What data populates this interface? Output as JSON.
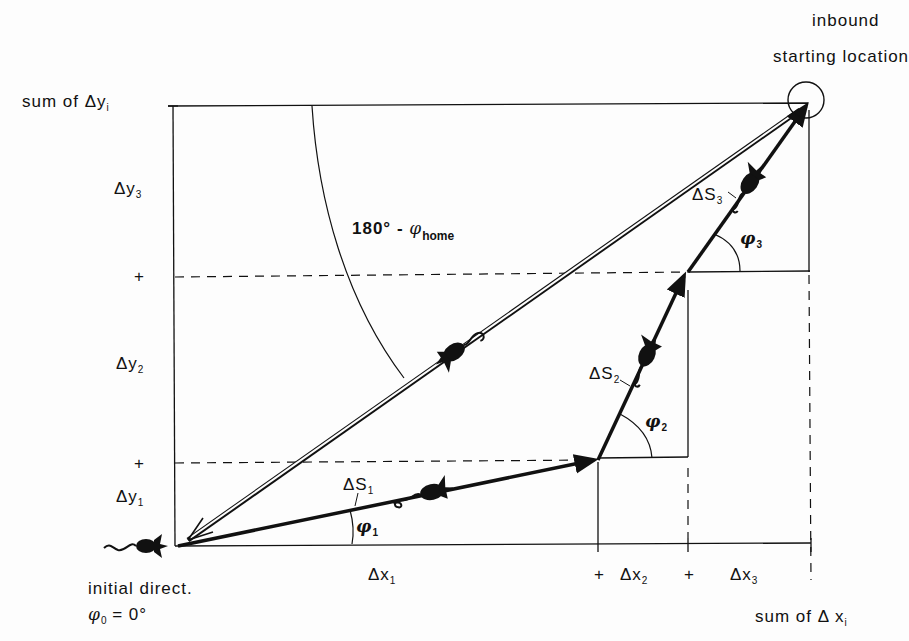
{
  "title_top_right": {
    "line1": "inbound",
    "line2": "starting location"
  },
  "y_axis": {
    "sum_label": "sum of Δy",
    "sum_sub": "i",
    "components": [
      {
        "label": "Δy",
        "sub": "3"
      },
      {
        "label": "Δy",
        "sub": "2"
      },
      {
        "label": "Δy",
        "sub": "1"
      }
    ],
    "plus_marks": [
      "+",
      "+"
    ]
  },
  "x_axis": {
    "sum_label": "sum of Δ x",
    "sum_sub": "i",
    "components": [
      {
        "label": "Δx",
        "sub": "1"
      },
      {
        "label": "Δx",
        "sub": "2"
      },
      {
        "label": "Δx",
        "sub": "3"
      }
    ],
    "plus_marks": [
      "+",
      "+"
    ]
  },
  "segments": [
    {
      "label": "ΔS",
      "sub": "1",
      "angle_label": "φ",
      "angle_sub": "1"
    },
    {
      "label": "ΔS",
      "sub": "2",
      "angle_label": "φ",
      "angle_sub": "2"
    },
    {
      "label": "ΔS",
      "sub": "3",
      "angle_label": "φ",
      "angle_sub": "3"
    }
  ],
  "home_angle": {
    "prefix": "180° - ",
    "symbol": "φ",
    "sub": "home"
  },
  "initial": {
    "line1": "initial direct.",
    "phi": "φ",
    "phi_sub": "0",
    "value": " = 0°"
  },
  "colors": {
    "ink": "#111111",
    "background": "#fdfdfd"
  }
}
